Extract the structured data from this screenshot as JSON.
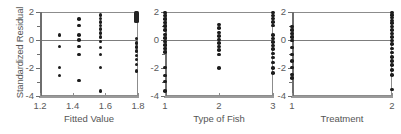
{
  "figure": {
    "ylabel": "Standardized Residual",
    "ylim": [
      -4,
      2
    ],
    "yticks": [
      2,
      0,
      -2,
      -4
    ],
    "ytick_labels": [
      "2",
      "0",
      "-2",
      "-4"
    ],
    "zero_reference_line": 0,
    "marker_color": "#1c1c1c",
    "axis_color": "#8c8c8c",
    "background": "#ffffff"
  },
  "panels": [
    {
      "id": "fitted-value",
      "xlabel": "Fitted Value",
      "xticks": [
        1.2,
        1.4,
        1.6,
        1.8
      ],
      "xtick_labels": [
        "1.2",
        "1.4",
        "1.6",
        "1.8"
      ],
      "xlim": [
        1.2,
        1.8
      ]
    },
    {
      "id": "type-of-fish",
      "xlabel": "Type of Fish",
      "xticks": [
        1,
        2,
        3
      ],
      "xtick_labels": [
        "1",
        "2",
        "3"
      ],
      "xlim": [
        1,
        3
      ]
    },
    {
      "id": "treatment",
      "xlabel": "Treatment",
      "xticks": [
        1,
        2
      ],
      "xtick_labels": [
        "1",
        "2"
      ],
      "xlim": [
        1,
        2
      ]
    }
  ],
  "chart_data": [
    {
      "type": "scatter",
      "title": "",
      "xlabel": "Fitted Value",
      "ylabel": "Standardized Residual",
      "xlim": [
        1.2,
        1.8
      ],
      "ylim": [
        -4,
        2
      ],
      "xticks": [
        1.2,
        1.4,
        1.6,
        1.8
      ],
      "yticks": [
        2,
        0,
        -2,
        -4
      ],
      "grid": false,
      "legend": "none",
      "reference_line_y": 0,
      "points": [
        {
          "x": 1.32,
          "y": 0.35
        },
        {
          "x": 1.32,
          "y": -0.45
        },
        {
          "x": 1.32,
          "y": -1.95
        },
        {
          "x": 1.32,
          "y": -2.55
        },
        {
          "x": 1.44,
          "y": 1.5
        },
        {
          "x": 1.44,
          "y": 1.05
        },
        {
          "x": 1.44,
          "y": 0.35
        },
        {
          "x": 1.44,
          "y": 0.0
        },
        {
          "x": 1.44,
          "y": -0.45
        },
        {
          "x": 1.44,
          "y": -1.05
        },
        {
          "x": 1.44,
          "y": -2.9
        },
        {
          "x": 1.57,
          "y": 1.8
        },
        {
          "x": 1.57,
          "y": 1.55
        },
        {
          "x": 1.57,
          "y": 1.3
        },
        {
          "x": 1.57,
          "y": 1.05
        },
        {
          "x": 1.57,
          "y": 0.8
        },
        {
          "x": 1.57,
          "y": 0.5
        },
        {
          "x": 1.57,
          "y": 0.2
        },
        {
          "x": 1.57,
          "y": -0.1
        },
        {
          "x": 1.57,
          "y": -0.55
        },
        {
          "x": 1.57,
          "y": -1.05
        },
        {
          "x": 1.57,
          "y": -1.95
        },
        {
          "x": 1.57,
          "y": -3.65
        },
        {
          "x": 1.79,
          "y": 1.95
        },
        {
          "x": 1.79,
          "y": 1.8
        },
        {
          "x": 1.79,
          "y": 1.65
        },
        {
          "x": 1.79,
          "y": 1.5
        },
        {
          "x": 1.79,
          "y": 1.35
        },
        {
          "x": 1.79,
          "y": 0.1
        },
        {
          "x": 1.79,
          "y": -0.2
        },
        {
          "x": 1.79,
          "y": -0.5
        },
        {
          "x": 1.79,
          "y": -0.8
        },
        {
          "x": 1.79,
          "y": -1.1
        },
        {
          "x": 1.79,
          "y": -1.4
        },
        {
          "x": 1.79,
          "y": -1.75
        },
        {
          "x": 1.79,
          "y": -2.2
        }
      ]
    },
    {
      "type": "scatter",
      "title": "",
      "xlabel": "Type of Fish",
      "ylabel": "Standardized Residual",
      "xlim": [
        1,
        3
      ],
      "ylim": [
        -4,
        2
      ],
      "xticks": [
        1,
        2,
        3
      ],
      "yticks": [
        2,
        0,
        -2,
        -4
      ],
      "grid": false,
      "legend": "none",
      "reference_line_y": 0,
      "points": [
        {
          "x": 1,
          "y": 1.95
        },
        {
          "x": 1,
          "y": 1.75
        },
        {
          "x": 1,
          "y": 1.5
        },
        {
          "x": 1,
          "y": 1.25
        },
        {
          "x": 1,
          "y": 1.0
        },
        {
          "x": 1,
          "y": 0.7
        },
        {
          "x": 1,
          "y": 0.4
        },
        {
          "x": 1,
          "y": 0.15
        },
        {
          "x": 1,
          "y": -0.1
        },
        {
          "x": 1,
          "y": -0.35
        },
        {
          "x": 1,
          "y": -0.6
        },
        {
          "x": 1,
          "y": -0.85
        },
        {
          "x": 1,
          "y": -1.95
        },
        {
          "x": 1,
          "y": -2.55
        },
        {
          "x": 1,
          "y": -2.95
        },
        {
          "x": 1,
          "y": -3.65
        },
        {
          "x": 2,
          "y": 1.1
        },
        {
          "x": 2,
          "y": 0.85
        },
        {
          "x": 2,
          "y": 0.55
        },
        {
          "x": 2,
          "y": 0.3
        },
        {
          "x": 2,
          "y": 0.05
        },
        {
          "x": 2,
          "y": -0.2
        },
        {
          "x": 2,
          "y": -0.45
        },
        {
          "x": 2,
          "y": -0.7
        },
        {
          "x": 2,
          "y": -1.05
        },
        {
          "x": 2,
          "y": -2.0
        },
        {
          "x": 3,
          "y": 1.95
        },
        {
          "x": 3,
          "y": 1.75
        },
        {
          "x": 3,
          "y": 1.55
        },
        {
          "x": 3,
          "y": 1.3
        },
        {
          "x": 3,
          "y": 1.05
        },
        {
          "x": 3,
          "y": 0.35
        },
        {
          "x": 3,
          "y": 0.1
        },
        {
          "x": 3,
          "y": -0.15
        },
        {
          "x": 3,
          "y": -0.4
        },
        {
          "x": 3,
          "y": -0.65
        },
        {
          "x": 3,
          "y": -0.95
        },
        {
          "x": 3,
          "y": -1.25
        },
        {
          "x": 3,
          "y": -1.6
        },
        {
          "x": 3,
          "y": -2.0
        },
        {
          "x": 3,
          "y": -2.35
        }
      ]
    },
    {
      "type": "scatter",
      "title": "",
      "xlabel": "Treatment",
      "ylabel": "Standardized Residual",
      "xlim": [
        1,
        2
      ],
      "ylim": [
        -4,
        2
      ],
      "xticks": [
        1,
        2
      ],
      "yticks": [
        2,
        0,
        -2,
        -4
      ],
      "grid": false,
      "legend": "none",
      "reference_line_y": 0,
      "points": [
        {
          "x": 1,
          "y": 0.95
        },
        {
          "x": 1,
          "y": 0.7
        },
        {
          "x": 1,
          "y": 0.45
        },
        {
          "x": 1,
          "y": 0.2
        },
        {
          "x": 1,
          "y": -0.05
        },
        {
          "x": 1,
          "y": -0.55
        },
        {
          "x": 1,
          "y": -1.05
        },
        {
          "x": 1,
          "y": -1.5
        },
        {
          "x": 1,
          "y": -1.95
        },
        {
          "x": 1,
          "y": -2.45
        },
        {
          "x": 1,
          "y": -2.7
        },
        {
          "x": 2,
          "y": 1.95
        },
        {
          "x": 2,
          "y": 1.8
        },
        {
          "x": 2,
          "y": 1.6
        },
        {
          "x": 2,
          "y": 1.4
        },
        {
          "x": 2,
          "y": 1.2
        },
        {
          "x": 2,
          "y": 0.95
        },
        {
          "x": 2,
          "y": 0.7
        },
        {
          "x": 2,
          "y": 0.45
        },
        {
          "x": 2,
          "y": 0.2
        },
        {
          "x": 2,
          "y": -0.05
        },
        {
          "x": 2,
          "y": -0.3
        },
        {
          "x": 2,
          "y": -0.6
        },
        {
          "x": 2,
          "y": -0.9
        },
        {
          "x": 2,
          "y": -1.2
        },
        {
          "x": 2,
          "y": -1.5
        },
        {
          "x": 2,
          "y": -1.8
        },
        {
          "x": 2,
          "y": -2.15
        },
        {
          "x": 2,
          "y": -2.5
        },
        {
          "x": 2,
          "y": -3.55
        }
      ]
    }
  ]
}
